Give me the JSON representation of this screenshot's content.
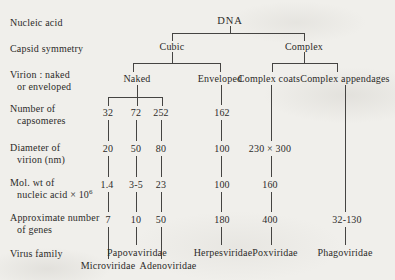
{
  "diagram": {
    "title_node": "DNA",
    "row_labels": {
      "nucleic_acid": "Nucleic acid",
      "capsid_symmetry": "Capsid symmetry",
      "virion_1": "Virion : naked",
      "virion_2": "or enveloped",
      "capsomeres_1": "Number of",
      "capsomeres_2": "capsomeres",
      "diameter_1": "Diameter of",
      "diameter_2": "virion (nm)",
      "mol_wt_1": "Mol. wt of",
      "mol_wt_2": "nucleic acid × 10",
      "mol_wt_exponent": "6",
      "genes_1": "Approximate number",
      "genes_2": "of genes",
      "virus_family": "Virus family"
    },
    "nodes": {
      "dna": "DNA",
      "cubic": "Cubic",
      "complex": "Complex",
      "naked": "Naked",
      "enveloped": "Enveloped",
      "complex_coats": "Complex coats",
      "complex_appendages": "Complex appendages"
    },
    "values": {
      "capsomeres": [
        "32",
        "72",
        "252",
        "162"
      ],
      "diameter": [
        "20",
        "50",
        "80",
        "100",
        "230 × 300"
      ],
      "mol_wt": [
        "1.4",
        "3-5",
        "23",
        "100",
        "160"
      ],
      "genes": [
        "7",
        "10",
        "50",
        "180",
        "400",
        "32-130"
      ],
      "families": [
        "Microviridae",
        "Papovaviridae",
        "Adenoviridae",
        "Herpesviridae",
        "Poxviridae",
        "Phagoviridae"
      ]
    },
    "colors": {
      "paper": "#f0efeb",
      "ink": "#2c2b29",
      "line": "#454442"
    }
  }
}
